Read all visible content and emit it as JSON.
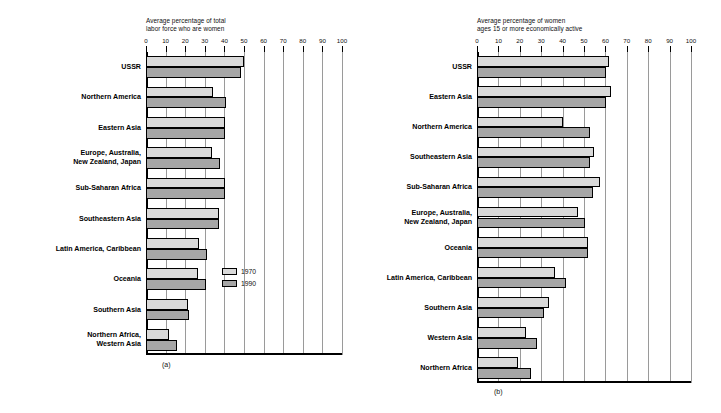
{
  "figure": {
    "legend": {
      "items": [
        {
          "label": "1970",
          "color": "#d9d9d9",
          "key": "y1970"
        },
        {
          "label": "1990",
          "color": "#a6a6a6",
          "key": "y1990"
        }
      ]
    }
  },
  "panel_a": {
    "caption": "(a)",
    "title": "Average percentage of total\nlabor force who are women"
  },
  "panel_b": {
    "caption": "(b)",
    "title": "Average percentage of women\nages 15 or more economically active"
  },
  "chart_data": [
    {
      "id": "panel_a",
      "type": "bar",
      "orientation": "horizontal",
      "title": "Average percentage of total labor force who are women",
      "xlabel": "",
      "ylabel": "",
      "xlim": [
        0,
        100
      ],
      "xticks": [
        0,
        10,
        20,
        30,
        40,
        50,
        60,
        70,
        80,
        90,
        100
      ],
      "grid": true,
      "legend_position": "inside-right",
      "categories": [
        "USSR",
        "Northern America",
        "Eastern Asia",
        "Europe, Australia,\nNew Zealand, Japan",
        "Sub-Saharan Africa",
        "Southeastern Asia",
        "Latin America, Caribbean",
        "Oceania",
        "Southern Asia",
        "Northern Africa,\nWestern Asia"
      ],
      "series": [
        {
          "name": "1970",
          "color": "#d9d9d9",
          "values": [
            50.2,
            34.0,
            40.5,
            33.5,
            40.5,
            37.0,
            27.0,
            26.5,
            21.5,
            11.5
          ]
        },
        {
          "name": "1990",
          "color": "#a6a6a6",
          "values": [
            48.5,
            41.0,
            40.5,
            38.0,
            40.5,
            37.0,
            31.0,
            30.5,
            22.0,
            16.0
          ]
        }
      ]
    },
    {
      "id": "panel_b",
      "type": "bar",
      "orientation": "horizontal",
      "title": "Average percentage of women ages 15 or more economically active",
      "xlabel": "",
      "ylabel": "",
      "xlim": [
        0,
        100
      ],
      "xticks": [
        0,
        10,
        20,
        30,
        40,
        50,
        60,
        70,
        80,
        90,
        100
      ],
      "grid": true,
      "legend_position": "none",
      "categories": [
        "USSR",
        "Eastern Asia",
        "Northern America",
        "Southeastern Asia",
        "Sub-Saharan Africa",
        "Europe, Australia,\nNew Zealand, Japan",
        "Oceania",
        "Latin America, Caribbean",
        "Southern Asia",
        "Western Asia",
        "Northern Africa"
      ],
      "series": [
        {
          "name": "1970",
          "color": "#d9d9d9",
          "values": [
            61.5,
            62.5,
            40.0,
            54.5,
            57.5,
            47.0,
            52.0,
            36.5,
            33.5,
            23.0,
            19.0
          ]
        },
        {
          "name": "1990",
          "color": "#a6a6a6",
          "values": [
            60.5,
            60.5,
            53.0,
            53.0,
            54.0,
            50.5,
            52.0,
            41.5,
            31.5,
            28.0,
            25.0
          ]
        }
      ]
    }
  ]
}
